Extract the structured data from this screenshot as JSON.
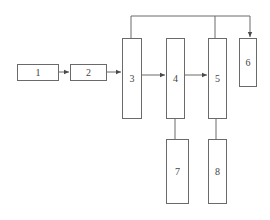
{
  "diagram": {
    "type": "block-flow",
    "colors": {
      "stroke": "#6a6a6a",
      "text": "#444444",
      "background": "#ffffff"
    },
    "blocks": [
      {
        "id": "1",
        "label": "1"
      },
      {
        "id": "2",
        "label": "2"
      },
      {
        "id": "3",
        "label": "3"
      },
      {
        "id": "4",
        "label": "4"
      },
      {
        "id": "5",
        "label": "5"
      },
      {
        "id": "6",
        "label": "6"
      },
      {
        "id": "7",
        "label": "7"
      },
      {
        "id": "8",
        "label": "8"
      }
    ],
    "connections": [
      {
        "from": "1",
        "to": "2",
        "arrow": true
      },
      {
        "from": "2",
        "to": "3",
        "arrow": true
      },
      {
        "from": "3",
        "to": "4",
        "arrow": true
      },
      {
        "from": "4",
        "to": "5",
        "arrow": true
      },
      {
        "from": "3",
        "to": "6",
        "arrow": true,
        "route": "top-bus"
      },
      {
        "from": "5",
        "to": "6",
        "arrow": true,
        "route": "top-bus"
      },
      {
        "from": "4",
        "to": "7",
        "arrow": false
      },
      {
        "from": "5",
        "to": "8",
        "arrow": false
      }
    ]
  }
}
